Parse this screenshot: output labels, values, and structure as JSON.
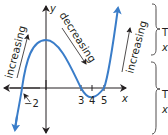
{
  "graph": {
    "axis_labels": {
      "x": "x",
      "y": "y"
    },
    "tick_labels": [
      "−2",
      "3",
      "4",
      "5"
    ],
    "interval_labels": [
      "increasing",
      "decreasing",
      "increasing"
    ],
    "curve_color": "#3a7dc9",
    "axis_color": "#231f20",
    "function_points": [
      {
        "x": -2,
        "y": 0
      },
      {
        "x": 0,
        "y": 4
      },
      {
        "x": 3,
        "y": 0
      },
      {
        "x": 4,
        "y": -0.7
      },
      {
        "x": 5,
        "y": 0
      }
    ]
  },
  "side_notes": [
    {
      "line1": "T",
      "line2": "x"
    },
    {
      "line1": "T",
      "line2": "x"
    }
  ]
}
